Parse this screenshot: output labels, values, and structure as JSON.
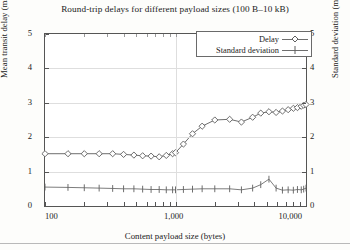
{
  "chart_data": {
    "type": "line",
    "title": "Round-trip delays for different payload sizes (100 B–10 kB)",
    "xlabel": "Content payload size (bytes)",
    "ylabel": "Mean transit delay (ms)",
    "ylabel_right": "Standard deviation (ms)",
    "xscale": "log",
    "xlim": [
      100,
      10000
    ],
    "ylim": [
      0,
      5
    ],
    "ylim_right": [
      0,
      5
    ],
    "grid": true,
    "legend_position": "top-right",
    "xticks": [
      "100",
      "1,000",
      "10,000"
    ],
    "xtick_values": [
      100,
      1000,
      10000
    ],
    "yticks": [
      "0",
      "1",
      "2",
      "3",
      "4",
      "5"
    ],
    "ytick_values": [
      0,
      1,
      2,
      3,
      4,
      5
    ],
    "yticks_right": [
      "0",
      "1",
      "2",
      "3",
      "4",
      "5"
    ],
    "x": [
      100,
      150,
      200,
      260,
      330,
      400,
      480,
      560,
      650,
      750,
      850,
      950,
      1000,
      1150,
      1350,
      1600,
      2000,
      2600,
      3200,
      3900,
      4500,
      5200,
      5900,
      6600,
      7300,
      8000,
      8600,
      9200,
      9600,
      10000
    ],
    "series": [
      {
        "name": "Delay",
        "marker": "diamond",
        "color": "#6e6e6e",
        "values": [
          1.52,
          1.52,
          1.52,
          1.52,
          1.52,
          1.5,
          1.48,
          1.46,
          1.45,
          1.43,
          1.47,
          1.52,
          1.55,
          1.8,
          2.1,
          2.32,
          2.5,
          2.52,
          2.44,
          2.58,
          2.7,
          2.74,
          2.72,
          2.76,
          2.8,
          2.84,
          2.86,
          2.9,
          2.93,
          2.95
        ]
      },
      {
        "name": "Standard deviation",
        "marker": "plus",
        "color": "#7d7d7d",
        "values": [
          0.55,
          0.54,
          0.53,
          0.52,
          0.51,
          0.5,
          0.5,
          0.49,
          0.48,
          0.48,
          0.47,
          0.47,
          0.47,
          0.48,
          0.49,
          0.5,
          0.5,
          0.5,
          0.47,
          0.52,
          0.62,
          0.78,
          0.52,
          0.46,
          0.47,
          0.46,
          0.48,
          0.47,
          0.49,
          0.52
        ]
      }
    ]
  },
  "legend": {
    "items": [
      {
        "label": "Delay",
        "marker": "diamond"
      },
      {
        "label": "Standard deviation",
        "marker": "plus"
      }
    ]
  },
  "colors": {
    "frame": "#555555",
    "grid": "#dedede",
    "series_delay": "#6e6e6e",
    "series_stddev": "#7d7d7d",
    "text": "#222222",
    "background": "#ffffff"
  }
}
